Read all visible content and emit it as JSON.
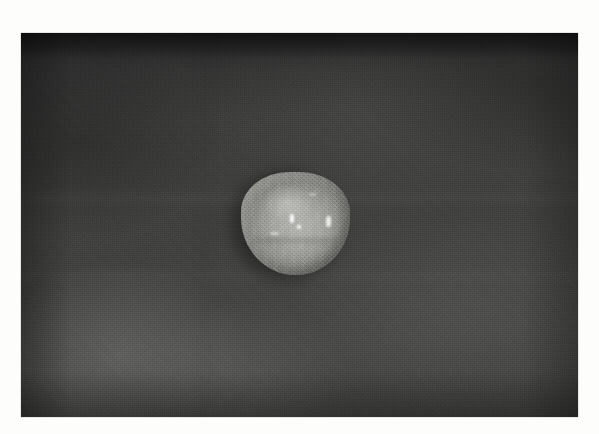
{
  "image": {
    "kind": "grayscale-photograph",
    "title": "",
    "caption": "",
    "plate": {
      "left_px": 21,
      "top_px": 33,
      "width_px": 557,
      "height_px": 384,
      "background_color": "#414140",
      "darkest_color": "#222222",
      "lightest_background_color": "#575756",
      "margin_color": "#fdfdfc"
    },
    "subject": {
      "name": "specimen",
      "shape": "rounded-triangular blob",
      "center_x_px": 294,
      "center_y_px": 222,
      "width_px": 109,
      "height_px": 103,
      "fill_color": "#a9a9a5",
      "highlight_color": "#c4c4c0",
      "shadow_color": "#8a8a86",
      "halo_color": "#2a2a2a",
      "specks": [
        {
          "x_px": 290,
          "y_px": 214,
          "size_px": 4
        },
        {
          "x_px": 297,
          "y_px": 225,
          "size_px": 4
        },
        {
          "x_px": 326,
          "y_px": 216,
          "size_px": 5
        },
        {
          "x_px": 270,
          "y_px": 232,
          "size_px": 9
        },
        {
          "x_px": 309,
          "y_px": 193,
          "size_px": 7
        }
      ]
    },
    "background_features": [
      {
        "name": "top-dark-band",
        "description": "darker horizontal band across the top edge"
      },
      {
        "name": "lower-left-light-patch",
        "description": "lighter mottled patch in the lower-left quadrant"
      },
      {
        "name": "film-grain",
        "description": "fine halftone grain across the whole plate"
      }
    ]
  }
}
